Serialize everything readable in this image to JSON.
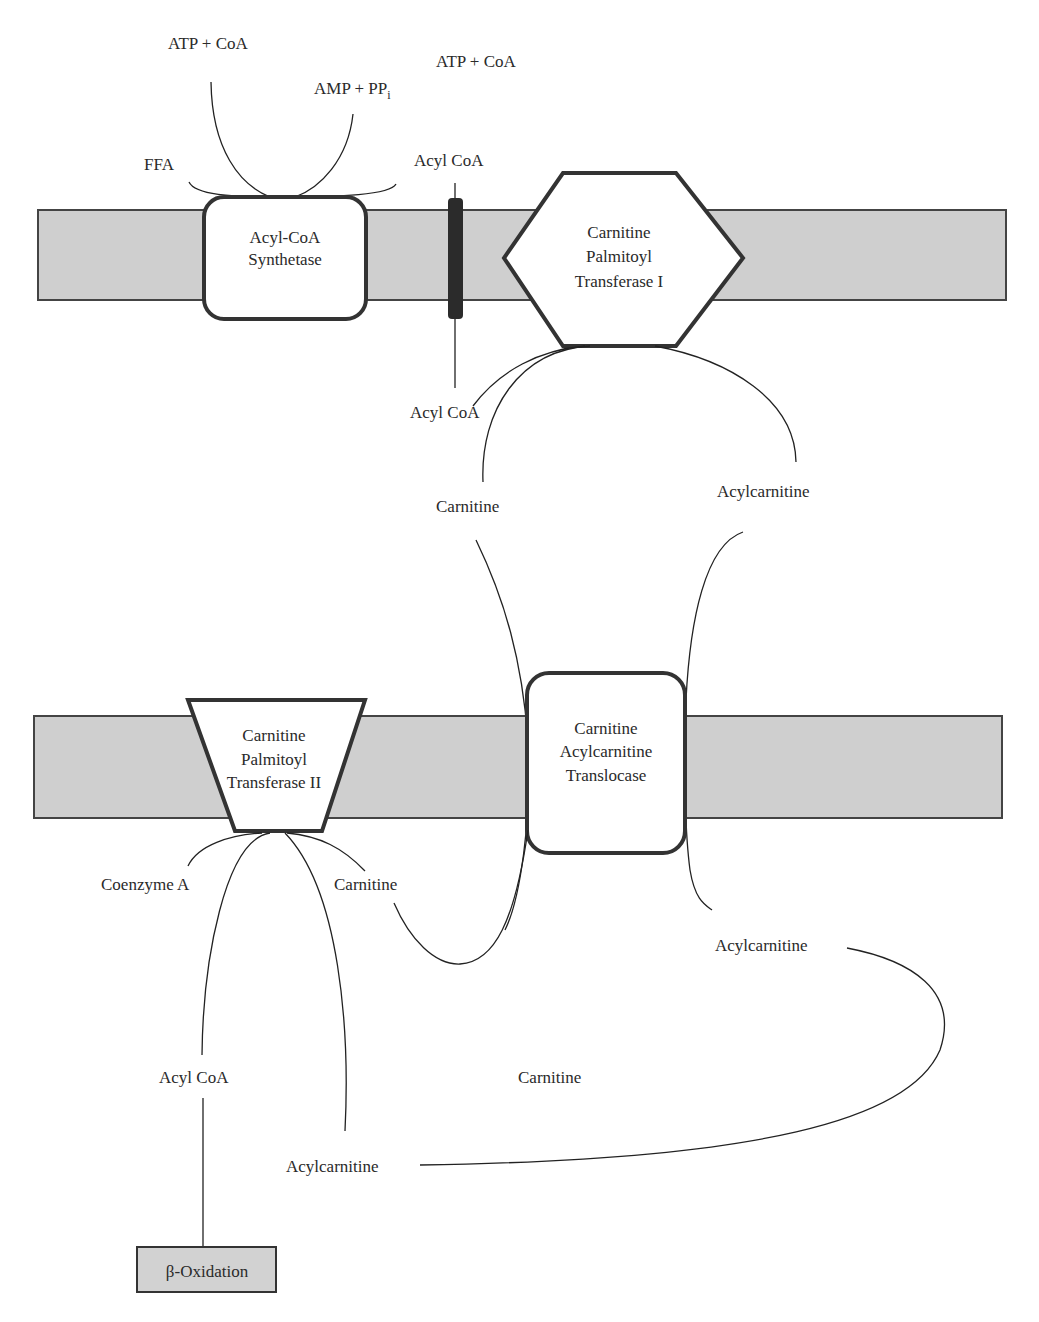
{
  "diagram": {
    "membranes": [
      {
        "name": "outer-mitochondrial-membrane",
        "fill": "#cfcfcf"
      },
      {
        "name": "inner-mitochondrial-membrane",
        "fill": "#cfcfcf"
      }
    ],
    "enzymes": {
      "acyl_coa_synthetase": [
        "Acyl-CoA",
        "Synthetase"
      ],
      "cpt1": [
        "Carnitine",
        "Palmitoyl",
        "Transferase I"
      ],
      "translocase": [
        "Carnitine",
        "Acylcarnitine",
        "Translocase"
      ],
      "cpt2": [
        "Carnitine",
        "Palmitoyl",
        "Transferase II"
      ]
    },
    "labels": {
      "atp_coa_1": "ATP + CoA",
      "atp_coa_2": "ATP + CoA",
      "amp_ppi": "AMP + PP",
      "amp_ppi_sub": "i",
      "ffa": "FFA",
      "acyl_coa_top": "Acyl CoA",
      "acyl_coa_mid": "Acyl CoA",
      "carnitine_mid": "Carnitine",
      "acylcarnitine_mid": "Acylcarnitine",
      "coenzyme_a": "Coenzyme A",
      "carnitine_cpt2": "Carnitine",
      "acylcarnitine_right": "Acylcarnitine",
      "acyl_coa_bottom": "Acyl CoA",
      "carnitine_bottom": "Carnitine",
      "acylcarnitine_bottom": "Acylcarnitine"
    },
    "output": {
      "beta_oxidation": "β-Oxidation"
    }
  }
}
